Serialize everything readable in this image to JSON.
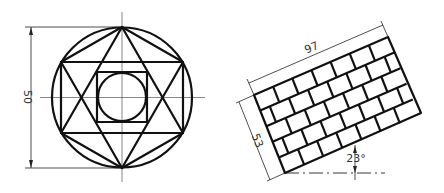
{
  "figures": [
    {
      "name": "hexagram-in-circle",
      "dimension_label": "50",
      "outer_circle": {
        "cx": 122,
        "cy": 97.5,
        "r": 70
      },
      "hexagon_vertices": [
        [
          122,
          27
        ],
        [
          183,
          62
        ],
        [
          183,
          133
        ],
        [
          122,
          168
        ],
        [
          61,
          133
        ],
        [
          61,
          62
        ]
      ],
      "inner_square": {
        "x": 97,
        "y": 72,
        "w": 50,
        "h": 50
      },
      "inner_circle": {
        "cx": 122,
        "cy": 97,
        "r": 24
      }
    },
    {
      "name": "brick-pattern-rectangle",
      "length_label": "97",
      "width_label": "53",
      "angle_label": "23°",
      "corners": {
        "tl": [
          254,
          95
        ],
        "tr": [
          388,
          37
        ],
        "br": [
          421,
          113
        ],
        "bl": [
          285,
          173
        ]
      },
      "rows": 5,
      "bricks_per_row": 7
    }
  ],
  "colors": {
    "line": "#111111",
    "dimension": "#333333",
    "background": "#ffffff"
  }
}
